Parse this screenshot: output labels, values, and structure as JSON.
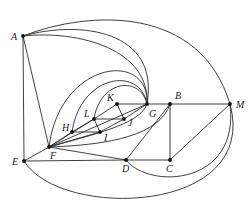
{
  "diagram": {
    "type": "graph",
    "vertices": [
      {
        "id": "A",
        "x": 23,
        "y": 36,
        "label": "A",
        "lx": 11,
        "ly": 40
      },
      {
        "id": "B",
        "x": 170,
        "y": 104,
        "label": "B",
        "lx": 175,
        "ly": 99
      },
      {
        "id": "M",
        "x": 230,
        "y": 104,
        "label": "M",
        "lx": 236,
        "ly": 108
      },
      {
        "id": "G",
        "x": 147,
        "y": 104,
        "label": "G",
        "lx": 149,
        "ly": 117
      },
      {
        "id": "K",
        "x": 117,
        "y": 104,
        "label": "K",
        "lx": 107,
        "ly": 101
      },
      {
        "id": "L",
        "x": 94,
        "y": 119,
        "label": "L",
        "lx": 84,
        "ly": 117
      },
      {
        "id": "J",
        "x": 124,
        "y": 119,
        "label": "J",
        "lx": 128,
        "ly": 126
      },
      {
        "id": "H",
        "x": 72,
        "y": 132,
        "label": "H",
        "lx": 62,
        "ly": 131
      },
      {
        "id": "I",
        "x": 100,
        "y": 132,
        "label": "I",
        "lx": 104,
        "ly": 141
      },
      {
        "id": "F",
        "x": 49,
        "y": 147,
        "label": "F",
        "lx": 50,
        "ly": 159
      },
      {
        "id": "E",
        "x": 24,
        "y": 161,
        "label": "E",
        "lx": 12,
        "ly": 165
      },
      {
        "id": "D",
        "x": 126,
        "y": 160,
        "label": "D",
        "lx": 122,
        "ly": 172
      },
      {
        "id": "C",
        "x": 170,
        "y": 160,
        "label": "C",
        "lx": 166,
        "ly": 172
      }
    ],
    "edges": [
      {
        "from": "A",
        "to": "E",
        "d": "M23,36 L24,161"
      },
      {
        "from": "A",
        "to": "F",
        "d": "M23,36 L49,147"
      },
      {
        "from": "A",
        "to": "M",
        "d": "M23,36 C90,10 200,5 230,104"
      },
      {
        "from": "A",
        "to": "G-outer",
        "d": "M23,36 C80,20 160,30 147,104"
      },
      {
        "from": "A",
        "to": "G-inner",
        "d": "M23,36 C80,30 150,50 147,104"
      },
      {
        "from": "F",
        "to": "G-arc",
        "d": "M49,147 C60,60 150,50 147,104"
      },
      {
        "from": "H",
        "to": "G-arc",
        "d": "M72,132 C80,75 140,65 147,104"
      },
      {
        "from": "L",
        "to": "G-arc",
        "d": "M94,119 C100,80 140,75 147,104"
      },
      {
        "from": "K",
        "to": "G",
        "d": "M117,104 L147,104"
      },
      {
        "from": "G",
        "to": "B",
        "d": "M147,104 L170,104"
      },
      {
        "from": "B",
        "to": "M",
        "d": "M170,104 L230,104"
      },
      {
        "from": "B",
        "to": "C",
        "d": "M170,104 L170,160"
      },
      {
        "from": "G",
        "to": "D",
        "d": "M170,104 L126,160"
      },
      {
        "from": "M",
        "to": "C",
        "d": "M230,104 L170,160"
      },
      {
        "from": "D",
        "to": "C",
        "d": "M126,160 L170,160"
      },
      {
        "from": "E",
        "to": "D",
        "d": "M24,161 L126,160"
      },
      {
        "from": "E",
        "to": "F",
        "d": "M24,161 L49,147"
      },
      {
        "from": "F",
        "to": "D",
        "d": "M49,147 L126,160"
      },
      {
        "from": "F",
        "to": "H",
        "d": "M49,147 L72,132"
      },
      {
        "from": "F",
        "to": "I",
        "d": "M49,147 L100,132"
      },
      {
        "from": "F",
        "to": "L",
        "d": "M49,147 L94,119"
      },
      {
        "from": "F",
        "to": "G",
        "d": "M49,147 L147,104"
      },
      {
        "from": "F",
        "to": "G-curve",
        "d": "M49,147 C90,135 140,125 147,104"
      },
      {
        "from": "F",
        "to": "B",
        "d": "M49,147 C110,145 160,135 170,104"
      },
      {
        "from": "H",
        "to": "I",
        "d": "M72,132 L100,132"
      },
      {
        "from": "H",
        "to": "L",
        "d": "M72,132 L94,119"
      },
      {
        "from": "L",
        "to": "K",
        "d": "M94,119 L117,104"
      },
      {
        "from": "L",
        "to": "J",
        "d": "M94,119 L124,119"
      },
      {
        "from": "L",
        "to": "I",
        "d": "M94,119 L100,132"
      },
      {
        "from": "K",
        "to": "J",
        "d": "M117,104 L124,119"
      },
      {
        "from": "I",
        "to": "J",
        "d": "M100,132 L124,119"
      },
      {
        "from": "J",
        "to": "G",
        "d": "M124,119 L147,104"
      },
      {
        "from": "D",
        "to": "M",
        "d": "M126,160 C150,190 240,185 230,104"
      },
      {
        "from": "E",
        "to": "M",
        "d": "M24,161 C60,220 260,215 230,104"
      }
    ]
  }
}
